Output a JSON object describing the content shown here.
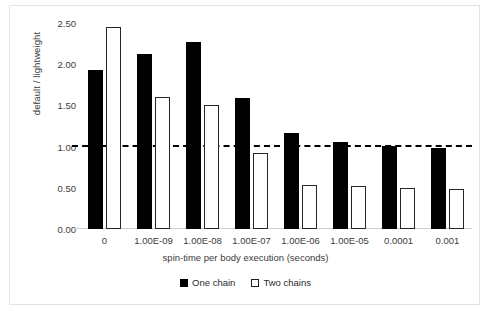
{
  "chart_data": {
    "type": "bar",
    "title": "",
    "subtitle": "",
    "xlabel": "spin-time per body execution (seconds)",
    "ylabel": "default / lightweight",
    "categories": [
      "0",
      "1.00E-09",
      "1.00E-08",
      "1.00E-07",
      "1.00E-06",
      "1.00E-05",
      "0.0001",
      "0.001"
    ],
    "series": [
      {
        "name": "One chain",
        "color": "#000000",
        "style": "filled",
        "values": [
          1.93,
          2.13,
          2.27,
          1.59,
          1.16,
          1.05,
          1.01,
          0.98
        ]
      },
      {
        "name": "Two chains",
        "color": "#ffffff",
        "style": "hollow",
        "values": [
          2.45,
          1.6,
          1.5,
          0.92,
          0.54,
          0.52,
          0.5,
          0.49
        ]
      }
    ],
    "ylim": [
      0.0,
      2.5
    ],
    "ytick_step": 0.5,
    "ytick_labels": [
      "0.00",
      "0.50",
      "1.00",
      "1.50",
      "2.00",
      "2.50"
    ],
    "ytick_values": [
      0.0,
      0.5,
      1.0,
      1.5,
      2.0,
      2.5
    ],
    "grid": false,
    "legend_position": "bottom",
    "annotations": [
      {
        "type": "hline",
        "name": "parity-threshold",
        "value": 1.0,
        "style": "dashed",
        "color": "#000000"
      }
    ]
  }
}
